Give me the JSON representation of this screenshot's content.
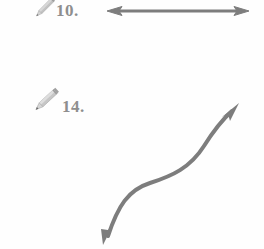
{
  "page": {
    "kind": "worksheet-figure-fragment",
    "background_color": "#fefefe",
    "ink_color": "#7d7d7d",
    "label_color": "#8e8e8e",
    "pencil_color": "#b9b9b9"
  },
  "items": [
    {
      "id": "item-10",
      "number_label": "10.",
      "icon": "pencil-icon",
      "figure": "double-headed-straight-arrow",
      "figure_description": "Horizontal line segment with arrowheads at both ends",
      "orientation": "horizontal"
    },
    {
      "id": "item-14",
      "number_label": "14.",
      "icon": "pencil-icon",
      "figure": "double-headed-curved-arrow",
      "figure_description": "S-shaped curve with arrowheads at both ends, pointing down-left and up-right",
      "orientation": "diagonal"
    }
  ],
  "figures": {
    "straight_arrow": {
      "name": "double-headed-straight-arrow",
      "x_start": 108,
      "x_end": 248,
      "y": 11,
      "stroke_width": 3,
      "color": "#7d7d7d",
      "arrowheads": [
        "start",
        "end"
      ]
    },
    "curved_arrow": {
      "name": "double-headed-curved-arrow",
      "start_point": [
        104,
        243
      ],
      "end_point": [
        238,
        105
      ],
      "inflection_point": [
        166,
        180
      ],
      "stroke_width": 4,
      "color": "#7d7d7d",
      "arrowheads": [
        "start",
        "end"
      ]
    }
  }
}
